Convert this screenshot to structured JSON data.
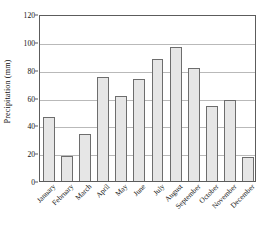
{
  "chart_data": {
    "type": "bar",
    "title": "",
    "subtitle": "",
    "xlabel": "",
    "ylabel": "Precipitation (mm)",
    "categories": [
      "January",
      "February",
      "March",
      "April",
      "May",
      "June",
      "July",
      "August",
      "September",
      "October",
      "November",
      "December"
    ],
    "values": [
      46,
      18,
      34,
      75,
      61,
      73.5,
      87.5,
      96,
      81,
      54,
      58.5,
      17.5
    ],
    "ylim": [
      0,
      120
    ],
    "yticks": [
      0,
      20,
      40,
      60,
      80,
      100,
      120
    ],
    "ytick_labels": [
      "0",
      "20",
      "40",
      "60",
      "80",
      "100",
      "120"
    ],
    "grid": true,
    "grid_axis": "y",
    "legend": false,
    "legend_position": "none",
    "bar_fill_color": "#e6e6e6",
    "bar_edge_color": "#6d6d6d",
    "grid_color": "#b9b9b9",
    "frame_color": "#5c5c5c",
    "text_color": "#111111",
    "background_color": "#ffffff",
    "xtick_label_rotation": -45
  }
}
